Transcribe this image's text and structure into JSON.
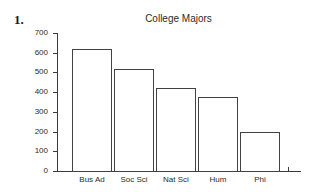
{
  "problem": {
    "number": "1."
  },
  "chart_data": {
    "type": "bar",
    "title": "College Majors",
    "xlabel": "",
    "ylabel": "",
    "categories": [
      "Bus Ad",
      "Soc Sci",
      "Nat Sci",
      "Hum",
      "Phi"
    ],
    "values": [
      620,
      515,
      420,
      375,
      200
    ],
    "ylim": [
      0,
      700
    ],
    "yticks": [
      0,
      100,
      200,
      300,
      400,
      500,
      600,
      700
    ],
    "ytick_labels": [
      "0",
      "100",
      "200",
      "300",
      "400",
      "500",
      "600",
      "700"
    ],
    "grid": false,
    "legend": false,
    "bar_fill_color": "#ffffff",
    "bar_edge_color": "#424242",
    "axis_color": "#3a3a3a",
    "background_color": "#ffffff"
  }
}
